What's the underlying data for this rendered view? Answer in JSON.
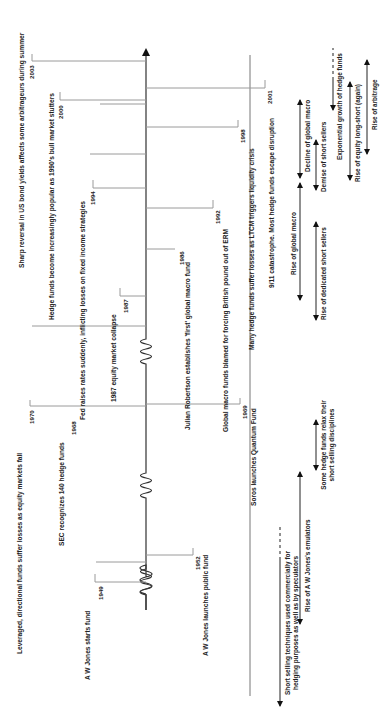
{
  "diagram": {
    "orientation": "rotated-90-ccw",
    "events_above_axis": [
      {
        "year": "1949",
        "text": "A W Jones starts fund"
      },
      {
        "year": "1968",
        "text": "SEC recognizes 140 hedge funds"
      },
      {
        "year": "1970",
        "text": "Leveraged, directional funds suffer losses as equity markets fall"
      },
      {
        "year": "1987",
        "text": "1987 equity market collapse"
      },
      {
        "year": "1994",
        "text": "Fed raises rates suddenly, inflicting losses on fixed income strategies"
      },
      {
        "year": "2000",
        "text": "Hedge funds become increasingly popular as 1990's bull market stutters"
      },
      {
        "year": "2003",
        "text": "Sharp reversal in US bond yields affects some arbitrageurs during summer"
      }
    ],
    "events_below_axis": [
      {
        "year": "1952",
        "text": "A W Jones launches public fund"
      },
      {
        "year": "1969",
        "text": "Soros launches Quantum Fund"
      },
      {
        "year": "1986",
        "text": "Julian Robertson establishes 'first' global macro fund"
      },
      {
        "year": "1992",
        "text": "Global macro funds blamed for forcing British pound out of ERM"
      },
      {
        "year": "1998",
        "text": "Many hedge funds suffer losses as LTCM triggers liquidity crisis"
      },
      {
        "year": "2001",
        "text": "9/11 catastrophe.  Most hedge funds escape disruption"
      }
    ],
    "trends": [
      {
        "text": "Short selling techniques used commercially for hedging purposes as well as by speculators",
        "style": "arrow-with-dashed-end"
      },
      {
        "text": "Rise of A W Jones's emulators",
        "style": "double-arrow"
      },
      {
        "text": "Some hedge funds relax their short selling disciplines",
        "style": "double-arrow"
      },
      {
        "text": "Rise of global macro",
        "style": "double-arrow"
      },
      {
        "text": "Rise of dedicated short sellers",
        "style": "double-arrow"
      },
      {
        "text": "Decline of global macro",
        "style": "double-arrow"
      },
      {
        "text": "Demise of short sellers",
        "style": "double-arrow"
      },
      {
        "text": "Exponential growth of hedge funds",
        "style": "arrow-with-dashed-end"
      },
      {
        "text": "Rise of equity long-short (again)",
        "style": "double-arrow"
      },
      {
        "text": "Rise of arbitrage",
        "style": "double-arrow"
      }
    ],
    "colors": {
      "axis": "#333333",
      "connector": "#9a9a9a",
      "text": "#222222",
      "background": "#ffffff"
    }
  }
}
